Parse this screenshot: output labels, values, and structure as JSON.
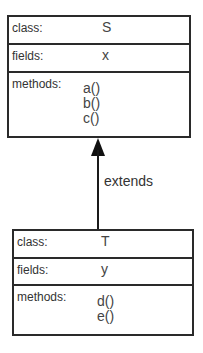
{
  "diagram": {
    "type": "uml-class-inheritance",
    "parent_class": {
      "class_label": "class:",
      "class_name": "S",
      "fields_label": "fields:",
      "fields": [
        "x"
      ],
      "methods_label": "methods:",
      "methods": [
        "a()",
        "b()",
        "c()"
      ]
    },
    "child_class": {
      "class_label": "class:",
      "class_name": "T",
      "fields_label": "fields:",
      "fields": [
        "y"
      ],
      "methods_label": "methods:",
      "methods": [
        "d()",
        "e()"
      ]
    },
    "relationship": {
      "label": "extends",
      "from": "T",
      "to": "S",
      "arrow": "filled-triangle"
    },
    "colors": {
      "line": "#2a2a2a",
      "text": "#333333",
      "background": "#ffffff"
    }
  }
}
